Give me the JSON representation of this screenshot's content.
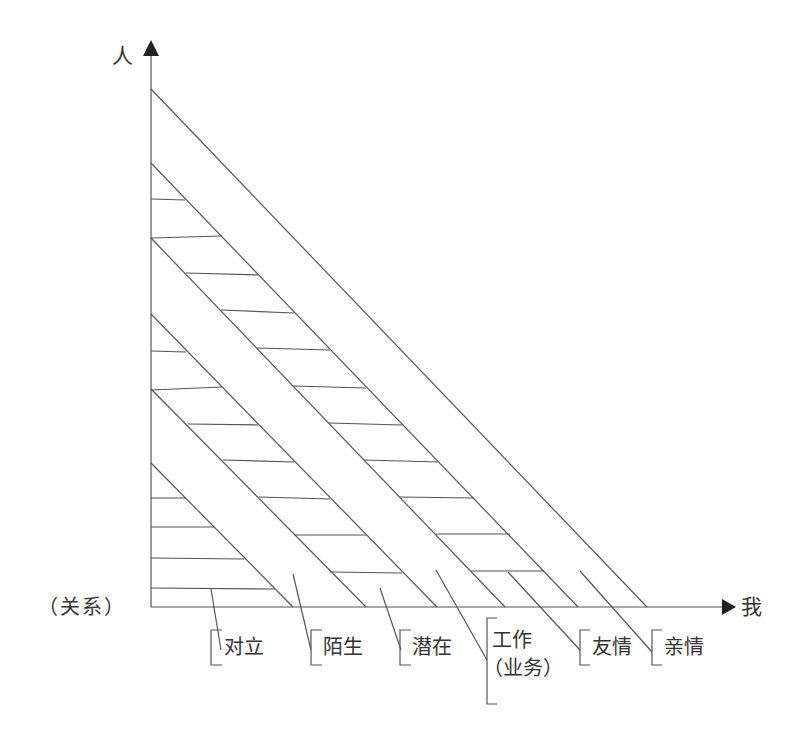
{
  "diagram": {
    "y_axis_label": "人",
    "x_axis_label": "我",
    "side_label": "（关系）",
    "bands": [
      {
        "label": "对立",
        "hatched": true
      },
      {
        "label": "陌生",
        "hatched": false
      },
      {
        "label": "潜在",
        "hatched": true
      },
      {
        "label": "工作",
        "label_line2": "（业务）",
        "hatched": false
      },
      {
        "label": "友情",
        "hatched": true
      },
      {
        "label": "亲情",
        "hatched": false
      }
    ],
    "line_color": "#555555"
  }
}
